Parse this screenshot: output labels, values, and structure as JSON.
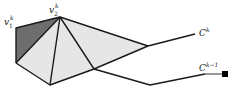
{
  "diagram": {
    "labels": {
      "v1": {
        "base": "v",
        "sub": "1",
        "sup": "k"
      },
      "v2": {
        "base": "v",
        "sub": "2",
        "sup": "k"
      },
      "ck": {
        "base": "C",
        "sup": "k"
      },
      "ck1": {
        "base": "C",
        "sup": "k−1"
      }
    },
    "colors": {
      "dark_fill": "#6e6e6e",
      "light_fill": "#e6e6e6",
      "stroke": "#1a1a1a",
      "endpoint": "#000000"
    }
  }
}
